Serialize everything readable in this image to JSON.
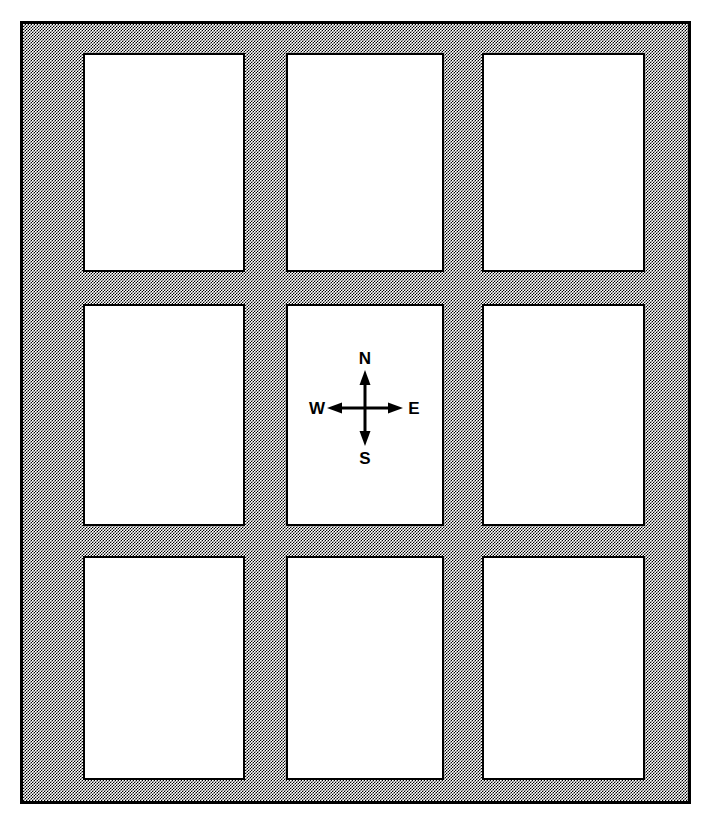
{
  "figure": {
    "kind": "map-plate-grid",
    "colors": {
      "background": "#ffffff",
      "frame_fill": "#999999",
      "frame_border": "#000000",
      "pane_fill": "#ffffff",
      "pane_border": "#000000",
      "ink": "#000000"
    },
    "frame": {
      "rows": 3,
      "columns": 3
    },
    "panes": [
      {
        "id": "r1c1",
        "row": 1,
        "column": 1,
        "content": ""
      },
      {
        "id": "r1c2",
        "row": 1,
        "column": 2,
        "content": ""
      },
      {
        "id": "r1c3",
        "row": 1,
        "column": 3,
        "content": ""
      },
      {
        "id": "r2c1",
        "row": 2,
        "column": 1,
        "content": ""
      },
      {
        "id": "r2c2",
        "row": 2,
        "column": 2,
        "content": ""
      },
      {
        "id": "r2c3",
        "row": 2,
        "column": 3,
        "content": ""
      },
      {
        "id": "r3c1",
        "row": 3,
        "column": 1,
        "content": ""
      },
      {
        "id": "r3c2",
        "row": 3,
        "column": 2,
        "content": ""
      },
      {
        "id": "r3c3",
        "row": 3,
        "column": 3,
        "content": ""
      }
    ],
    "compass": {
      "located_in_pane": "r2c2",
      "north": "N",
      "south": "S",
      "east": "E",
      "west": "W"
    }
  }
}
